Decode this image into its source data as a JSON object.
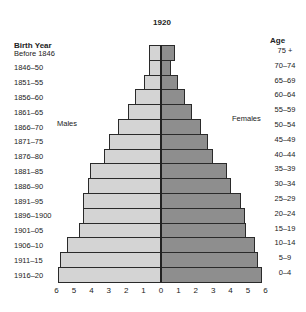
{
  "chart_data": {
    "type": "bar",
    "subtype": "population-pyramid",
    "title": "1920",
    "left_axis_header": "Birth Year",
    "right_axis_header": "Age",
    "series_labels": {
      "male": "Males",
      "female": "Females"
    },
    "birth_years": [
      "Before 1846",
      "1846–50",
      "1851–55",
      "1856–60",
      "1861–65",
      "1866–70",
      "1871–75",
      "1876–80",
      "1881–85",
      "1886–90",
      "1891–95",
      "1896–1900",
      "1901–05",
      "1906–10",
      "1911–15",
      "1916–20"
    ],
    "categories": [
      "75 +",
      "70–74",
      "65–69",
      "60–64",
      "55–59",
      "50–54",
      "45–49",
      "40–44",
      "35–39",
      "30–34",
      "25–29",
      "20–24",
      "15–19",
      "10–14",
      "5–9",
      "0–4"
    ],
    "series": [
      {
        "name": "Males",
        "color": "#d4d4d4",
        "values": [
          0.7,
          0.7,
          1.0,
          1.5,
          1.9,
          2.5,
          3.0,
          3.3,
          4.1,
          4.2,
          4.5,
          4.5,
          4.7,
          5.4,
          5.8,
          5.9
        ]
      },
      {
        "name": "Females",
        "color": "#8e8e8e",
        "values": [
          0.8,
          0.6,
          1.0,
          1.4,
          1.8,
          2.3,
          2.7,
          3.0,
          3.8,
          4.0,
          4.6,
          4.8,
          4.9,
          5.4,
          5.6,
          5.8
        ]
      }
    ],
    "x_ticks_left": [
      "6",
      "5",
      "4",
      "3",
      "2",
      "1",
      "0"
    ],
    "x_ticks_right": [
      "1",
      "2",
      "3",
      "4",
      "5",
      "6"
    ],
    "xlim": [
      -6,
      6
    ],
    "xlabel": "",
    "grid": false
  }
}
